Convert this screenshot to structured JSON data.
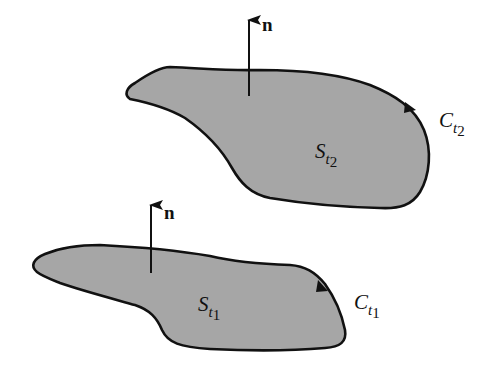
{
  "diagram": {
    "colors": {
      "fill": "#a6a6a6",
      "stroke": "#111111",
      "background": "#ffffff"
    },
    "upper_surface": {
      "surface_label": "S",
      "surface_sub": "t",
      "surface_subsub": "2",
      "curve_label": "C",
      "curve_sub": "t",
      "curve_subsub": "2",
      "normal_label": "n"
    },
    "lower_surface": {
      "surface_label": "S",
      "surface_sub": "t",
      "surface_subsub": "1",
      "curve_label": "C",
      "curve_sub": "t",
      "curve_subsub": "1",
      "normal_label": "n"
    }
  }
}
